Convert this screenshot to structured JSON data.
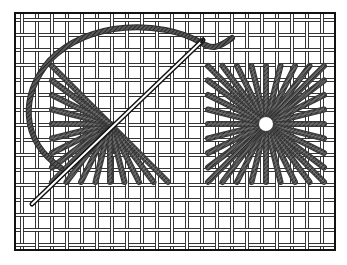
{
  "figure": {
    "alt": "Algerian eye stitch on needlepoint canvas with needle and thread",
    "width": 347,
    "height": 265
  },
  "canvas": {
    "frame": {
      "x": 15,
      "y": 13,
      "w": 320,
      "h": 237,
      "stroke": "#111111",
      "stroke_width": 2
    },
    "grid": {
      "spacing": 15,
      "x_start": 22,
      "y_start": 20,
      "thread_gap": 3,
      "thread_color": "#222222",
      "thread_width": 0.9,
      "fill": "#ffffff"
    }
  },
  "stitches": [
    {
      "name": "partial-star-stitch",
      "center": [
        110,
        124
      ],
      "half_size": 58,
      "rays_per_side": 8,
      "from_angle_deg": 135,
      "to_angle_deg": 320,
      "center_hole_r": 0
    },
    {
      "name": "completed-star-stitch",
      "center": [
        266,
        124
      ],
      "half_size": 58,
      "rays_per_side": 8,
      "from_angle_deg": 0,
      "to_angle_deg": 360,
      "center_hole_r": 7
    }
  ],
  "stitch_style": {
    "ray_color": "#3a3a3a",
    "ray_highlight": "#9a9a9a",
    "ray_width": 6
  },
  "needle": {
    "eye": [
      203,
      40
    ],
    "point": [
      32,
      204
    ],
    "color": "#111111",
    "width": 5
  },
  "thread": {
    "path": "M 61 168 C 20 140, 20 95, 50 60 C 90 20, 160 20, 200 42 C 212 50, 218 48, 232 38",
    "color": "#2e2e2e",
    "width": 6
  }
}
